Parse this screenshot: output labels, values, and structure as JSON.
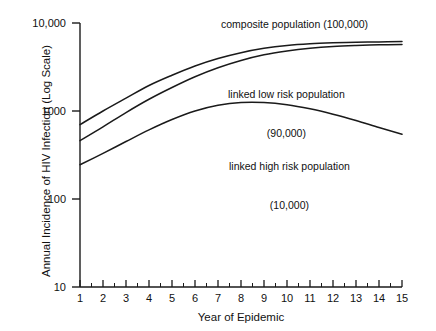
{
  "chart_data": {
    "type": "line",
    "title": "",
    "xlabel": "Year of Epidemic",
    "ylabel": "Annual Incidence of HIV Infection (Log Scale)",
    "yscale": "log",
    "xlim": [
      1,
      15
    ],
    "ylim": [
      10,
      10000
    ],
    "grid": false,
    "legend": "inline annotations",
    "xticks": [
      "1",
      "2",
      "3",
      "4",
      "5",
      "6",
      "7",
      "8",
      "9",
      "10",
      "11",
      "12",
      "13",
      "14",
      "15"
    ],
    "yticks": [
      "10",
      "100",
      "1000",
      "10,000"
    ],
    "x": [
      1,
      2,
      3,
      4,
      5,
      6,
      7,
      8,
      9,
      10,
      11,
      12,
      13,
      14,
      15
    ],
    "series": [
      {
        "name": "composite population (100,000)",
        "values": [
          700,
          1000,
          1400,
          1950,
          2550,
          3250,
          3950,
          4600,
          5150,
          5550,
          5800,
          5950,
          6050,
          6100,
          6150
        ],
        "annotation": "composite population (100,000)"
      },
      {
        "name": "linked low risk population (90,000)",
        "values": [
          460,
          660,
          960,
          1360,
          1850,
          2450,
          3100,
          3750,
          4350,
          4800,
          5150,
          5400,
          5550,
          5650,
          5700
        ],
        "annotation": "linked low risk population\n(90,000)"
      },
      {
        "name": "linked high risk population (10,000)",
        "values": [
          245,
          330,
          450,
          610,
          800,
          1000,
          1160,
          1250,
          1250,
          1180,
          1060,
          920,
          780,
          650,
          545
        ],
        "annotation": "linked high risk population\n(10,000)"
      }
    ],
    "colors": {
      "line": "#1a1a1a",
      "axis": "#1a1a1a",
      "background": "#ffffff"
    }
  },
  "axes": {
    "y_title": "Annual Incidence of HIV Infection (Log Scale)",
    "x_title": "Year of Epidemic",
    "y_tick_labels": [
      "10,000",
      "1000",
      "100",
      "10"
    ],
    "x_tick_labels": [
      "1",
      "2",
      "3",
      "4",
      "5",
      "6",
      "7",
      "8",
      "9",
      "10",
      "11",
      "12",
      "13",
      "14",
      "15"
    ]
  },
  "annotations": {
    "composite": "composite population (100,000)",
    "low_risk_line1": "linked low risk population",
    "low_risk_line2": "(90,000)",
    "high_risk_line1": "linked high risk population",
    "high_risk_line2": "(10,000)"
  }
}
